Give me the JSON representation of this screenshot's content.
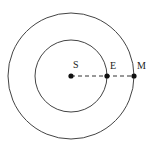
{
  "diagram": {
    "center": {
      "x": 71,
      "y": 76
    },
    "orbits": [
      {
        "name": "outer-orbit",
        "radius": 63
      },
      {
        "name": "inner-orbit",
        "radius": 36
      }
    ],
    "points": [
      {
        "label": "S",
        "x": 71,
        "y": 76
      },
      {
        "label": "E",
        "x": 107,
        "y": 76
      },
      {
        "label": "M",
        "x": 134,
        "y": 76
      }
    ],
    "line_style": "dashed",
    "colors": {
      "stroke": "#333333",
      "dot": "#111111"
    }
  }
}
